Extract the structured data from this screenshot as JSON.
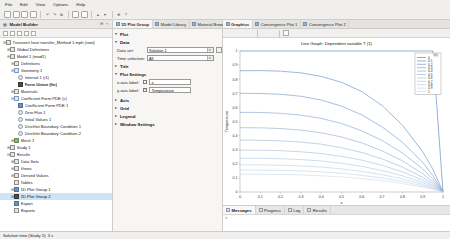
{
  "app": {
    "menu": [
      "File",
      "Edit",
      "View",
      "Options",
      "Help"
    ],
    "status": "Solution time (Study 1): 3 s"
  },
  "toolbar": {
    "icons": [
      "new-icon",
      "open-icon",
      "save-icon",
      "save-as-icon",
      "undo-icon",
      "redo-icon",
      "copy-icon",
      "paste-icon",
      "delete-icon",
      "build-icon",
      "compute-icon",
      "zoom-extents-icon",
      "help-icon"
    ]
  },
  "model_builder": {
    "title": "Model Builder",
    "pin_icon": "pin-icon",
    "tree_toolbar": [
      "collapse-icon",
      "expand-icon",
      "root-icon",
      "add-icon",
      "filter-icon"
    ],
    "nodes": [
      {
        "label": "Transient heat transfer_Method 1.mph (root)",
        "depth": 0,
        "icon": "model-root-icon",
        "twisty": "-",
        "selected": false,
        "bold": false
      },
      {
        "label": "Global Definitions",
        "depth": 1,
        "icon": "global-definitions-icon",
        "twisty": "+",
        "selected": false,
        "bold": false
      },
      {
        "label": "Model 1 (mod1)",
        "depth": 1,
        "icon": "model-icon",
        "twisty": "-",
        "selected": false,
        "bold": false
      },
      {
        "label": "Definitions",
        "depth": 2,
        "icon": "definitions-icon",
        "twisty": "+",
        "selected": false,
        "bold": false
      },
      {
        "label": "Geometry 1",
        "depth": 2,
        "icon": "geometry-icon",
        "twisty": "-",
        "selected": false,
        "bold": false
      },
      {
        "label": "Interval 1 (i1)",
        "depth": 3,
        "icon": "interval-icon",
        "twisty": "",
        "selected": false,
        "bold": false
      },
      {
        "label": "Form Union (fin)",
        "depth": 3,
        "icon": "form-union-icon",
        "twisty": "",
        "selected": false,
        "bold": true
      },
      {
        "label": "Materials",
        "depth": 2,
        "icon": "materials-icon",
        "twisty": "+",
        "selected": false,
        "bold": false
      },
      {
        "label": "Coefficient Form PDE (c)",
        "depth": 2,
        "icon": "physics-icon",
        "twisty": "-",
        "selected": false,
        "bold": false
      },
      {
        "label": "Coefficient Form PDE 1",
        "depth": 3,
        "icon": "pde-node-icon",
        "twisty": "",
        "selected": false,
        "bold": false
      },
      {
        "label": "Zero Flux 1",
        "depth": 3,
        "icon": "zero-flux-icon",
        "twisty": "",
        "selected": false,
        "bold": false
      },
      {
        "label": "Initial Values 1",
        "depth": 3,
        "icon": "initial-values-icon",
        "twisty": "",
        "selected": false,
        "bold": false
      },
      {
        "label": "Dirichlet Boundary Condition 1",
        "depth": 3,
        "icon": "dirichlet-icon",
        "twisty": "",
        "selected": false,
        "bold": false
      },
      {
        "label": "Dirichlet Boundary Condition 2",
        "depth": 3,
        "icon": "dirichlet-icon",
        "twisty": "",
        "selected": false,
        "bold": false
      },
      {
        "label": "Mesh 1",
        "depth": 2,
        "icon": "mesh-icon",
        "twisty": "+",
        "selected": false,
        "bold": false
      },
      {
        "label": "Study 1",
        "depth": 1,
        "icon": "study-icon",
        "twisty": "+",
        "selected": false,
        "bold": false
      },
      {
        "label": "Results",
        "depth": 1,
        "icon": "results-icon",
        "twisty": "-",
        "selected": false,
        "bold": false
      },
      {
        "label": "Data Sets",
        "depth": 2,
        "icon": "data-sets-icon",
        "twisty": "+",
        "selected": false,
        "bold": false
      },
      {
        "label": "Views",
        "depth": 2,
        "icon": "views-icon",
        "twisty": "+",
        "selected": false,
        "bold": false
      },
      {
        "label": "Derived Values",
        "depth": 2,
        "icon": "derived-values-icon",
        "twisty": "+",
        "selected": false,
        "bold": false
      },
      {
        "label": "Tables",
        "depth": 2,
        "icon": "tables-icon",
        "twisty": "",
        "selected": false,
        "bold": false
      },
      {
        "label": "1D Plot Group 1",
        "depth": 2,
        "icon": "plot-group-icon",
        "twisty": "+",
        "selected": false,
        "bold": false
      },
      {
        "label": "2D Plot Group 2",
        "depth": 2,
        "icon": "plot-group-2d-icon",
        "twisty": "+",
        "selected": true,
        "bold": false
      },
      {
        "label": "Export",
        "depth": 2,
        "icon": "export-icon",
        "twisty": "",
        "selected": false,
        "bold": false
      },
      {
        "label": "Reports",
        "depth": 2,
        "icon": "reports-icon",
        "twisty": "",
        "selected": false,
        "bold": false
      }
    ]
  },
  "settings": {
    "tabs": [
      {
        "label": "1D Plot Group",
        "icon": "plot-group-icon",
        "active": true
      },
      {
        "label": "Model Library",
        "icon": "model-library-icon",
        "active": false
      },
      {
        "label": "Material Browser",
        "icon": "material-browser-icon",
        "active": false
      }
    ],
    "sections": [
      {
        "name": "Plot",
        "arrow": "▾",
        "type": "header"
      },
      {
        "name": "Data",
        "arrow": "▾",
        "type": "header"
      },
      {
        "name": "Title",
        "arrow": "▸",
        "type": "header"
      },
      {
        "name": "Plot Settings",
        "arrow": "▾",
        "type": "header"
      },
      {
        "name": "Axis",
        "arrow": "▸",
        "type": "header"
      },
      {
        "name": "Grid",
        "arrow": "▸",
        "type": "header"
      },
      {
        "name": "Legend",
        "arrow": "▸",
        "type": "header"
      },
      {
        "name": "Window Settings",
        "arrow": "▸",
        "type": "header"
      }
    ],
    "data_set": {
      "label": "Data set:",
      "value": "Solution 1"
    },
    "time_selection": {
      "label": "Time selection:",
      "value": "All"
    },
    "x_axis_label": {
      "label": "x-axis label:",
      "checked": false,
      "value": "x"
    },
    "y_axis_label": {
      "label": "y-axis label:",
      "checked": true,
      "value": "Temperature"
    },
    "browse_icon": "browse-icon"
  },
  "graphics": {
    "tabs": [
      {
        "label": "Graphics",
        "icon": "graphics-icon",
        "active": true
      },
      {
        "label": "Convergence Plot 1",
        "icon": "convergence-icon",
        "active": false
      },
      {
        "label": "Convergence Plot 2",
        "icon": "convergence-icon",
        "active": false
      }
    ],
    "toolbar_icons": [
      "zoom-in-icon",
      "zoom-out-icon",
      "zoom-extents-icon",
      "zoom-box-icon",
      "transparency-icon",
      "reset-icon",
      "scene-light-icon",
      "image-snapshot-icon"
    ],
    "corner_label": "t(s)"
  },
  "messages": {
    "tabs": [
      {
        "label": "Messages",
        "icon": "messages-icon",
        "active": true
      },
      {
        "label": "Progress",
        "icon": "progress-icon",
        "active": false
      },
      {
        "label": "Log",
        "icon": "log-icon",
        "active": false
      },
      {
        "label": "Results",
        "icon": "results-tab-icon",
        "active": false
      }
    ],
    "body": ">"
  },
  "chart_data": {
    "type": "line",
    "title": "Line Graph: Dependent variable T (1)",
    "xlabel": "x",
    "ylabel": "Temperature",
    "xlim": [
      0,
      1
    ],
    "ylim": [
      0,
      1
    ],
    "xticks": [
      "0",
      "0.1",
      "0.2",
      "0.3",
      "0.4",
      "0.5",
      "0.6",
      "0.7",
      "0.8",
      "0.9",
      "1"
    ],
    "yticks": [
      "0",
      "0.1",
      "0.2",
      "0.3",
      "0.4",
      "0.5",
      "0.6",
      "0.7",
      "0.8",
      "0.9",
      "1"
    ],
    "grid": false,
    "legend_position": "upper right",
    "legend_title": "t(s)",
    "legend": [
      "0",
      "0.1",
      "0.2",
      "0.3",
      "0.4",
      "0.5",
      "0.6",
      "0.7",
      "0.8",
      "0.9",
      "1"
    ],
    "x": [
      0,
      0.1,
      0.2,
      0.3,
      0.4,
      0.5,
      0.6,
      0.7,
      0.8,
      0.9,
      0.95,
      1
    ],
    "series": [
      {
        "name": "0",
        "color": "#3b6fb5",
        "values": [
          1,
          1,
          1,
          1,
          1,
          1,
          1,
          1,
          1,
          1,
          1,
          0
        ]
      },
      {
        "name": "0.1",
        "color": "#4f7fbe",
        "values": [
          0.86,
          0.861,
          0.857,
          0.845,
          0.82,
          0.778,
          0.712,
          0.613,
          0.474,
          0.286,
          0.162,
          0
        ]
      },
      {
        "name": "0.2",
        "color": "#5f8cc4",
        "values": [
          0.7,
          0.699,
          0.693,
          0.679,
          0.652,
          0.609,
          0.547,
          0.462,
          0.353,
          0.21,
          0.117,
          0
        ]
      },
      {
        "name": "0.3",
        "color": "#6f99ca",
        "values": [
          0.565,
          0.564,
          0.558,
          0.545,
          0.522,
          0.486,
          0.434,
          0.365,
          0.277,
          0.164,
          0.091,
          0
        ]
      },
      {
        "name": "0.4",
        "color": "#7ea4cf",
        "values": [
          0.456,
          0.455,
          0.45,
          0.439,
          0.42,
          0.39,
          0.348,
          0.292,
          0.221,
          0.13,
          0.072,
          0
        ]
      },
      {
        "name": "0.5",
        "color": "#8cafd4",
        "values": [
          0.368,
          0.367,
          0.363,
          0.354,
          0.339,
          0.314,
          0.28,
          0.235,
          0.177,
          0.104,
          0.058,
          0
        ]
      },
      {
        "name": "0.6",
        "color": "#99b9d9",
        "values": [
          0.297,
          0.296,
          0.293,
          0.285,
          0.273,
          0.253,
          0.226,
          0.189,
          0.143,
          0.084,
          0.046,
          0
        ]
      },
      {
        "name": "0.7",
        "color": "#a5c1dd",
        "values": [
          0.239,
          0.239,
          0.236,
          0.23,
          0.22,
          0.204,
          0.182,
          0.152,
          0.115,
          0.067,
          0.037,
          0
        ]
      },
      {
        "name": "0.8",
        "color": "#b0c9e1",
        "values": [
          0.193,
          0.193,
          0.19,
          0.185,
          0.177,
          0.164,
          0.146,
          0.123,
          0.093,
          0.054,
          0.03,
          0
        ]
      },
      {
        "name": "0.9",
        "color": "#bad0e5",
        "values": [
          0.156,
          0.155,
          0.154,
          0.15,
          0.143,
          0.133,
          0.118,
          0.099,
          0.075,
          0.044,
          0.024,
          0
        ]
      },
      {
        "name": "1",
        "color": "#c4d7e8",
        "values": [
          0.126,
          0.125,
          0.124,
          0.121,
          0.115,
          0.107,
          0.095,
          0.08,
          0.06,
          0.035,
          0.019,
          0
        ]
      }
    ]
  }
}
